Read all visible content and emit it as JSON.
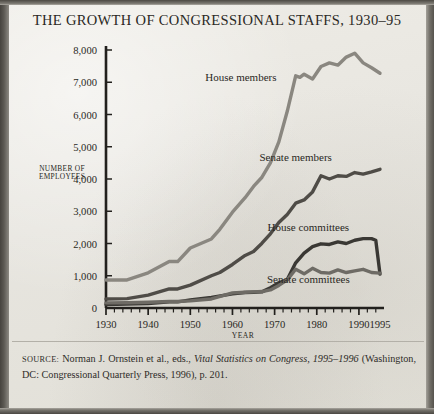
{
  "title": "THE GROWTH OF CONGRESSIONAL STAFFS, 1930–95",
  "axis": {
    "ylabel_line1": "NUMBER OF",
    "ylabel_line2": "EMPLOYEES",
    "xlabel": "YEAR"
  },
  "series_labels": {
    "house_members": "House members",
    "senate_members": "Senate members",
    "house_committees": "House committees",
    "senate_committees": "Senate committees"
  },
  "source": {
    "label": "SOURCE:",
    "text_before_italic": " Norman J. Ornstein et al., eds., ",
    "italic_title": "Vital Statistics on Congress, 1995–1996",
    "text_after": " (Washington, DC: Congressional Quarterly Press, 1996), p. 201."
  },
  "colors": {
    "paper": "#e9e7e1",
    "ink": "#2a2824",
    "axis": "#22201d",
    "house_members_line": "#8a8780",
    "senate_members_line": "#4f4c47",
    "house_committees_line": "#3a3834",
    "senate_committees_line": "#6e6b65"
  },
  "chart_data": {
    "type": "line",
    "title": "THE GROWTH OF CONGRESSIONAL STAFFS, 1930–95",
    "xlabel": "YEAR",
    "ylabel": "NUMBER OF EMPLOYEES",
    "xlim": [
      1930,
      1995
    ],
    "ylim": [
      0,
      8000
    ],
    "yticks": [
      0,
      1000,
      2000,
      3000,
      4000,
      5000,
      6000,
      7000,
      8000
    ],
    "ytick_labels": [
      "0",
      "1,000",
      "2,000",
      "3,000",
      "4,000",
      "5,000",
      "6,000",
      "7,000",
      "8,000"
    ],
    "xticks": [
      1930,
      1940,
      1950,
      1960,
      1970,
      1980,
      1990,
      1995
    ],
    "xtick_labels": [
      "1930",
      "1940",
      "1950",
      "1960",
      "1970",
      "1980",
      "1990",
      "1995"
    ],
    "xtick_minor_step": 2,
    "grid": false,
    "legend": "inline-annotations",
    "series": [
      {
        "name": "House members",
        "color": "#8a8780",
        "label_x": 1962,
        "label_y": 7050,
        "x": [
          1930,
          1935,
          1940,
          1945,
          1947,
          1950,
          1955,
          1957,
          1960,
          1963,
          1965,
          1967,
          1969,
          1971,
          1973,
          1975,
          1976,
          1977,
          1979,
          1981,
          1983,
          1985,
          1987,
          1989,
          1991,
          1993,
          1995
        ],
        "y": [
          870,
          870,
          1090,
          1440,
          1440,
          1860,
          2140,
          2440,
          2970,
          3420,
          3770,
          4055,
          4500,
          5150,
          6100,
          7200,
          7150,
          7250,
          7100,
          7490,
          7600,
          7530,
          7780,
          7900,
          7600,
          7450,
          7280
        ]
      },
      {
        "name": "Senate members",
        "color": "#4f4c47",
        "label_x": 1975,
        "label_y": 4560,
        "x": [
          1930,
          1935,
          1940,
          1945,
          1947,
          1950,
          1955,
          1957,
          1960,
          1963,
          1965,
          1967,
          1969,
          1971,
          1973,
          1975,
          1977,
          1979,
          1981,
          1983,
          1985,
          1987,
          1989,
          1991,
          1993,
          1995
        ],
        "y": [
          280,
          290,
          400,
          590,
          590,
          710,
          1000,
          1100,
          1350,
          1630,
          1750,
          2010,
          2300,
          2650,
          2900,
          3250,
          3350,
          3600,
          4100,
          4000,
          4100,
          4080,
          4200,
          4150,
          4220,
          4300
        ]
      },
      {
        "name": "House committees",
        "color": "#3a3834",
        "label_x": 1978,
        "label_y": 2390,
        "x": [
          1930,
          1935,
          1940,
          1945,
          1947,
          1950,
          1955,
          1960,
          1963,
          1965,
          1967,
          1969,
          1971,
          1973,
          1975,
          1977,
          1979,
          1981,
          1983,
          1985,
          1987,
          1989,
          1991,
          1993,
          1994,
          1995
        ],
        "y": [
          110,
          120,
          140,
          190,
          190,
          250,
          330,
          440,
          480,
          490,
          500,
          630,
          780,
          880,
          1400,
          1700,
          1900,
          1990,
          1970,
          2050,
          2000,
          2100,
          2150,
          2150,
          2100,
          1050
        ]
      },
      {
        "name": "Senate committees",
        "color": "#6e6b65",
        "label_x": 1978,
        "label_y": 790,
        "x": [
          1930,
          1935,
          1940,
          1945,
          1947,
          1950,
          1955,
          1960,
          1963,
          1965,
          1967,
          1969,
          1971,
          1973,
          1975,
          1977,
          1979,
          1981,
          1983,
          1985,
          1987,
          1989,
          1991,
          1993,
          1995
        ],
        "y": [
          160,
          165,
          180,
          200,
          200,
          220,
          280,
          470,
          490,
          500,
          510,
          560,
          700,
          870,
          1200,
          1060,
          1230,
          1100,
          1080,
          1180,
          1100,
          1150,
          1200,
          1100,
          1080
        ]
      }
    ]
  }
}
